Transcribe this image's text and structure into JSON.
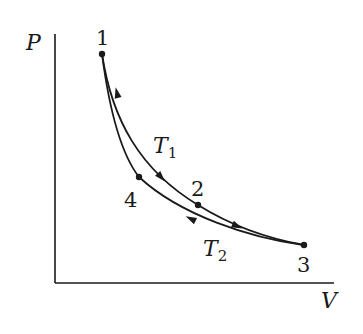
{
  "diagram": {
    "type": "PV cycle diagram",
    "axes": {
      "y_label": "P",
      "x_label": "V"
    },
    "points": [
      {
        "id": "1",
        "label": "1"
      },
      {
        "id": "2",
        "label": "2"
      },
      {
        "id": "3",
        "label": "3"
      },
      {
        "id": "4",
        "label": "4"
      }
    ],
    "curves": [
      {
        "from": "1",
        "to": "2",
        "label": "T",
        "subscript": "1"
      },
      {
        "from": "2",
        "to": "3",
        "label": ""
      },
      {
        "from": "3",
        "to": "4",
        "label": "T",
        "subscript": "2"
      },
      {
        "from": "4",
        "to": "1",
        "label": ""
      }
    ],
    "isotherm_labels": {
      "t1_main": "T",
      "t1_sub": "1",
      "t2_main": "T",
      "t2_sub": "2"
    },
    "colors": {
      "ink": "#1a1a1a",
      "background": "#ffffff"
    }
  }
}
